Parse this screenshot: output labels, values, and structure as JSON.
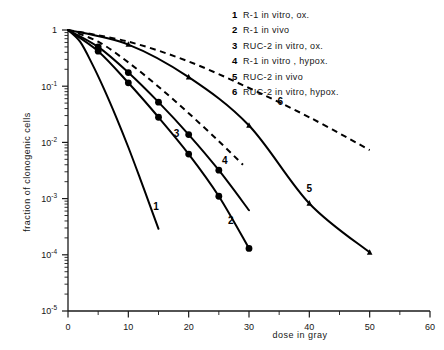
{
  "chart_data": {
    "type": "line",
    "title": "",
    "xlabel": "dose in gray",
    "ylabel": "fraction of clonogenic cells",
    "xlim": [
      0,
      60
    ],
    "ylim": [
      1e-05,
      1
    ],
    "yscale": "log",
    "grid": false,
    "legend_position": "top-right",
    "x_ticks_major": [
      0,
      10,
      20,
      30,
      40,
      50,
      60
    ],
    "x_tick_labels": [
      "0",
      "10",
      "20",
      "30",
      "40",
      "50",
      "60"
    ],
    "x_ticks_minor": [
      5,
      15,
      25,
      35,
      45,
      55
    ],
    "y_ticks_major": [
      1,
      0.1,
      0.01,
      0.001,
      0.0001,
      1e-05
    ],
    "y_tick_labels": [
      "1",
      "10",
      "10",
      "10",
      "10",
      "10"
    ],
    "y_tick_exponents": [
      "",
      "-1",
      "-2",
      "-3",
      "-4",
      "-5"
    ],
    "series": [
      {
        "id": "1",
        "name": "R-1 in vitro, ox.",
        "style": "solid",
        "marker": "none",
        "label_at": {
          "x": 14.6,
          "y": 0.00062
        },
        "points": [
          {
            "x": 0,
            "y": 1.0
          },
          {
            "x": 2,
            "y": 0.62
          },
          {
            "x": 4,
            "y": 0.25
          },
          {
            "x": 6,
            "y": 0.088
          },
          {
            "x": 8,
            "y": 0.028
          },
          {
            "x": 10,
            "y": 0.0082
          },
          {
            "x": 12,
            "y": 0.0022
          },
          {
            "x": 14,
            "y": 0.00057
          },
          {
            "x": 15,
            "y": 0.00029
          }
        ]
      },
      {
        "id": "2",
        "name": "R-1 in vivo",
        "style": "solid",
        "marker": "circle",
        "label_at": {
          "x": 27.0,
          "y": 0.00036
        },
        "points": [
          {
            "x": 0,
            "y": 1.0
          },
          {
            "x": 5,
            "y": 0.42
          },
          {
            "x": 10,
            "y": 0.115
          },
          {
            "x": 15,
            "y": 0.028
          },
          {
            "x": 20,
            "y": 0.0062
          },
          {
            "x": 25,
            "y": 0.0011
          },
          {
            "x": 30,
            "y": 0.00013
          }
        ],
        "marker_points": [
          {
            "x": 5,
            "y": 0.42
          },
          {
            "x": 10,
            "y": 0.115
          },
          {
            "x": 15,
            "y": 0.028
          },
          {
            "x": 20,
            "y": 0.0062
          },
          {
            "x": 25,
            "y": 0.0011
          },
          {
            "x": 30,
            "y": 0.00013
          }
        ]
      },
      {
        "id": "3",
        "name": "RUC-2 in vitro, ox.",
        "style": "solid",
        "marker": "circle",
        "label_at": {
          "x": 18.0,
          "y": 0.0125
        },
        "points": [
          {
            "x": 0,
            "y": 1.0
          },
          {
            "x": 5,
            "y": 0.5
          },
          {
            "x": 10,
            "y": 0.175
          },
          {
            "x": 15,
            "y": 0.052
          },
          {
            "x": 20,
            "y": 0.0138
          },
          {
            "x": 25,
            "y": 0.0032
          },
          {
            "x": 30,
            "y": 0.00062
          }
        ],
        "marker_points": [
          {
            "x": 5,
            "y": 0.5
          },
          {
            "x": 10,
            "y": 0.175
          },
          {
            "x": 15,
            "y": 0.052
          },
          {
            "x": 20,
            "y": 0.0138
          },
          {
            "x": 25,
            "y": 0.0032
          }
        ]
      },
      {
        "id": "4",
        "name": "R-1 in vitro , hypox.",
        "style": "dashed",
        "marker": "none",
        "label_at": {
          "x": 26.0,
          "y": 0.0042
        },
        "points": [
          {
            "x": 0,
            "y": 1.0
          },
          {
            "x": 5,
            "y": 0.62
          },
          {
            "x": 10,
            "y": 0.265
          },
          {
            "x": 15,
            "y": 0.098
          },
          {
            "x": 20,
            "y": 0.033
          },
          {
            "x": 25,
            "y": 0.0105
          },
          {
            "x": 29,
            "y": 0.004
          }
        ]
      },
      {
        "id": "5",
        "name": "RUC-2 in vivo",
        "style": "solid",
        "marker": "triangle",
        "label_at": {
          "x": 40.0,
          "y": 0.0013
        },
        "points": [
          {
            "x": 0,
            "y": 1.0
          },
          {
            "x": 10,
            "y": 0.55
          },
          {
            "x": 20,
            "y": 0.145
          },
          {
            "x": 30,
            "y": 0.02
          },
          {
            "x": 40,
            "y": 0.00082
          },
          {
            "x": 50,
            "y": 0.00011
          }
        ],
        "marker_points": [
          {
            "x": 10,
            "y": 0.55
          },
          {
            "x": 20,
            "y": 0.145
          },
          {
            "x": 30,
            "y": 0.02
          },
          {
            "x": 40,
            "y": 0.00082
          },
          {
            "x": 50,
            "y": 0.00011
          }
        ]
      },
      {
        "id": "6",
        "name": "RUC-2 in vitro, hypox.",
        "style": "dashed",
        "marker": "none",
        "label_at": {
          "x": 35.2,
          "y": 0.047
        },
        "points": [
          {
            "x": 0,
            "y": 1.0
          },
          {
            "x": 10,
            "y": 0.62
          },
          {
            "x": 20,
            "y": 0.275
          },
          {
            "x": 30,
            "y": 0.093
          },
          {
            "x": 40,
            "y": 0.028
          },
          {
            "x": 50,
            "y": 0.0073
          }
        ]
      }
    ],
    "legend_entries": [
      {
        "num": "1",
        "label": "R-1 in vitro, ox."
      },
      {
        "num": "2",
        "label": "R-1 in vivo"
      },
      {
        "num": "3",
        "label": "RUC-2 in vitro, ox."
      },
      {
        "num": "4",
        "label": "R-1 in vitro , hypox."
      },
      {
        "num": "5",
        "label": "RUC-2 in vivo"
      },
      {
        "num": "6",
        "label": "RUC-2 in vitro, hypox."
      }
    ]
  },
  "colors": {
    "ink": "#000000",
    "axis": "#1a1a1a",
    "background": "#ffffff"
  }
}
